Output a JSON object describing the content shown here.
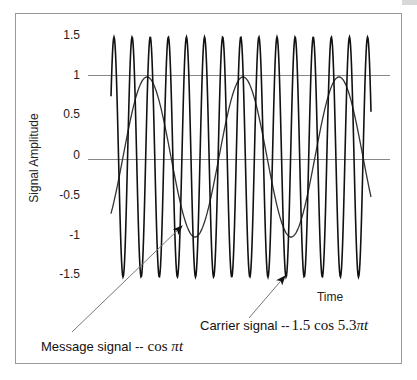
{
  "chart_data": {
    "type": "line",
    "title": "",
    "xlabel": "Time",
    "ylabel": "Signal Amplitude",
    "ylim": [
      -1.5,
      1.5
    ],
    "yticks": [
      "1.5",
      "1",
      "0.5",
      "0",
      "-0.5",
      "-1",
      "-1.5"
    ],
    "grid_lines_at": [
      1,
      0
    ],
    "series": [
      {
        "name": "Carrier signal",
        "formula": "1.5 cos 5.3πt",
        "amplitude": 1.5,
        "angular_frequency": "5.3π",
        "color": "#111111",
        "visible_cycles": 14
      },
      {
        "name": "Message signal",
        "formula": "cos πt",
        "amplitude": 1,
        "angular_frequency": "π",
        "color": "#333333",
        "visible_cycles": 2.7
      }
    ],
    "annotations": [
      {
        "text_prefix": "Carrier signal --",
        "math": "1.5 cos 5.3",
        "pi": "π",
        "var": "t"
      },
      {
        "text_prefix": "Message signal --",
        "math": "cos ",
        "pi": "π",
        "var": "t"
      }
    ]
  },
  "labels": {
    "ylabel": "Signal Amplitude",
    "xlabel": "Time",
    "ticks": [
      "1.5",
      "1",
      "0.5",
      "0",
      "-0.5",
      "-1",
      "-1.5"
    ],
    "carrier_prefix": "Carrier signal --",
    "carrier_math": "1.5 cos 5.3",
    "carrier_pi": "π",
    "carrier_var": "t",
    "message_prefix": "Message signal --",
    "message_math": "cos ",
    "message_pi": "π",
    "message_var": "t"
  }
}
